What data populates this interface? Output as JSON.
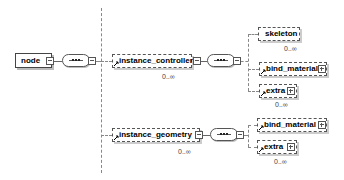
{
  "diagram": {
    "type": "xml-schema-tree",
    "root": {
      "label": "node"
    },
    "branches": [
      {
        "label": "instance_controller",
        "occurrence": "0..∞",
        "children": [
          {
            "label": "skeleton",
            "occurrence": "0..∞",
            "expandable": false
          },
          {
            "label": "bind_material",
            "occurrence": "",
            "expandable": true
          },
          {
            "label": "extra",
            "occurrence": "0..∞",
            "expandable": true
          }
        ]
      },
      {
        "label": "instance_geometry",
        "occurrence": "0..∞",
        "children": [
          {
            "label": "bind_material",
            "occurrence": "",
            "expandable": true
          },
          {
            "label": "extra",
            "occurrence": "0..∞",
            "expandable": true
          }
        ]
      }
    ],
    "icons": {
      "sequence": "sequence-compositor-icon",
      "collapse": "collapse-icon",
      "expand": "expand-icon",
      "reference": "reference-arrow-icon"
    }
  }
}
